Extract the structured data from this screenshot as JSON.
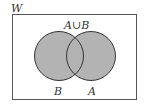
{
  "diagram": {
    "type": "venn",
    "universe_label": "W",
    "sets": [
      {
        "name": "B",
        "position": "left",
        "shaded": true
      },
      {
        "name": "A",
        "position": "right",
        "shaded": true
      }
    ],
    "region_label": "A∪B",
    "colors": {
      "fill": "#b3b3b3",
      "stroke": "#333333",
      "background": "#ffffff"
    }
  }
}
